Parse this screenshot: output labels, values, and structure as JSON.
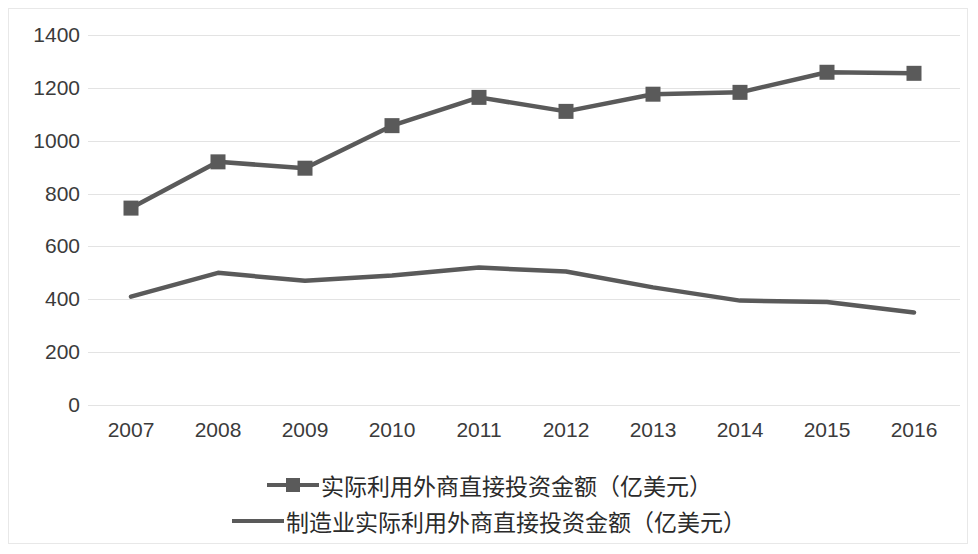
{
  "chart_data": {
    "type": "line",
    "title": "",
    "xlabel": "",
    "ylabel": "",
    "grid": true,
    "legend_position": "bottom",
    "categories": [
      "2007",
      "2008",
      "2009",
      "2010",
      "2011",
      "2012",
      "2013",
      "2014",
      "2015",
      "2016"
    ],
    "ylim": [
      0,
      1400
    ],
    "yticks": [
      "0",
      "200",
      "400",
      "600",
      "800",
      "1000",
      "1200",
      "1400"
    ],
    "ytick_values": [
      0,
      200,
      400,
      600,
      800,
      1000,
      1200,
      1400
    ],
    "series": [
      {
        "name": "实际利用外商直接投资金额（亿美元）",
        "marker": "square",
        "color": "#5a5a5a",
        "values": [
          745,
          920,
          896,
          1057,
          1164,
          1111,
          1176,
          1183,
          1259,
          1255
        ]
      },
      {
        "name": "制造业实际利用外商直接投资金额（亿美元）",
        "marker": "none",
        "color": "#5a5a5a",
        "values": [
          410,
          500,
          470,
          490,
          520,
          505,
          445,
          395,
          390,
          350
        ]
      }
    ]
  },
  "legend": {
    "items": [
      {
        "label": "实际利用外商直接投资金额（亿美元）",
        "marker": "square"
      },
      {
        "label": "制造业实际利用外商直接投资金额（亿美元）",
        "marker": "none"
      }
    ]
  },
  "colors": {
    "series": "#5a5a5a",
    "gridline": "#e3e3e3",
    "text": "#3b3b3b",
    "frame": "#e8e8e8",
    "background": "#ffffff"
  }
}
